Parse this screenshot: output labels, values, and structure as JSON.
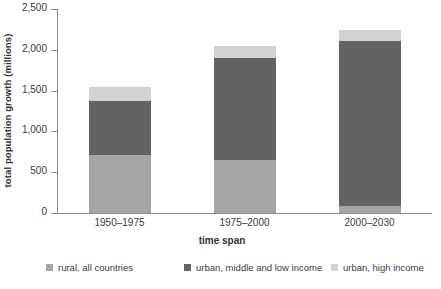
{
  "chart_data": {
    "type": "bar",
    "subtype": "stacked-bar",
    "title": "",
    "xlabel": "time span",
    "ylabel": "total population growth (millions)",
    "categories": [
      "1950–1975",
      "1975–2000",
      "2000–2030"
    ],
    "series": [
      {
        "name": "rural, all countries",
        "color": "#a6a6a6",
        "values": [
          710,
          650,
          85
        ]
      },
      {
        "name": "urban, middle and low income",
        "color": "#636363",
        "values": [
          660,
          1250,
          2020
        ]
      },
      {
        "name": "urban, high income",
        "color": "#d2d2d2",
        "values": [
          170,
          145,
          135
        ]
      }
    ],
    "stack_order": [
      "rural, all countries",
      "urban, middle and low income",
      "urban, high income"
    ],
    "totals": [
      1540,
      2045,
      2240
    ],
    "ylim": [
      0,
      2500
    ],
    "yticks": [
      0,
      500,
      1000,
      1500,
      2000,
      2500
    ],
    "ytick_labels": [
      "0",
      "500",
      "1,000",
      "1,500",
      "2,000",
      "2,500"
    ],
    "grid": false,
    "legend_position": "bottom"
  },
  "axes": {
    "y_title": "total population growth (millions)",
    "x_title": "time span"
  },
  "legend": {
    "items": [
      {
        "label": "rural, all countries",
        "color": "#a6a6a6"
      },
      {
        "label": "urban, middle and low income",
        "color": "#636363"
      },
      {
        "label": "urban, high income",
        "color": "#d2d2d2"
      }
    ]
  }
}
